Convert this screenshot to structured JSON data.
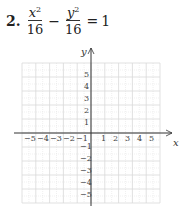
{
  "problem": {
    "number": "2.",
    "term1_numerator_var": "x",
    "term1_numerator_exp": "2",
    "term1_denominator": "16",
    "operator": "−",
    "term2_numerator_var": "y",
    "term2_numerator_exp": "2",
    "term2_denominator": "16",
    "equals": "=",
    "rhs": "1"
  },
  "graph": {
    "x_axis_label": "x",
    "y_axis_label": "y",
    "x_ticks_negative": [
      "−5",
      "−4",
      "−3",
      "−2",
      "−1"
    ],
    "x_ticks_positive": [
      "1",
      "2",
      "3",
      "4",
      "5"
    ],
    "y_ticks_positive": [
      "5",
      "4",
      "3",
      "2",
      "1"
    ],
    "y_ticks_negative": [
      "−1",
      "−2",
      "−3",
      "−4",
      "−5"
    ],
    "range": {
      "xmin": -5,
      "xmax": 5,
      "ymin": -5,
      "ymax": 5
    },
    "grid_color": "#d9d9d9",
    "axis_color": "#333333"
  }
}
